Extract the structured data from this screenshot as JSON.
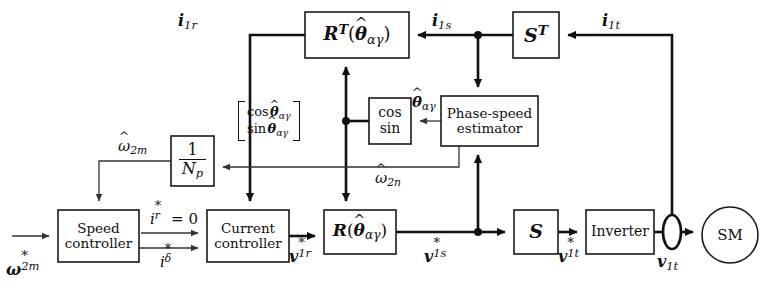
{
  "figure": {
    "type": "block-diagram",
    "background": "#ffffff",
    "line_color": "#111111",
    "width": 784,
    "height": 292
  },
  "blocks": [
    {
      "id": "rt",
      "name": "rotation-transform-inverse-block",
      "label": "R^T(θ̂_αγ)",
      "x": 305,
      "y": 12,
      "w": 104,
      "h": 46
    },
    {
      "id": "st",
      "name": "s-transform-transpose-block",
      "label": "S^T",
      "x": 513,
      "y": 12,
      "w": 46,
      "h": 46
    },
    {
      "id": "cossin",
      "name": "cos-sin-block",
      "label": "cos sin",
      "x": 369,
      "y": 98,
      "w": 42,
      "h": 46
    },
    {
      "id": "estimator",
      "name": "phase-speed-estimator-block",
      "label": "Phase-speed estimator",
      "x": 441,
      "y": 96,
      "w": 97,
      "h": 50
    },
    {
      "id": "invnp",
      "name": "inverse-pole-pairs-block",
      "label": "1 / N_p",
      "x": 171,
      "y": 136,
      "w": 43,
      "h": 50
    },
    {
      "id": "speed",
      "name": "speed-controller-block",
      "label": "Speed controller",
      "x": 58,
      "y": 210,
      "w": 81,
      "h": 52
    },
    {
      "id": "current",
      "name": "current-controller-block",
      "label": "Current controller",
      "x": 207,
      "y": 210,
      "w": 82,
      "h": 52
    },
    {
      "id": "r",
      "name": "rotation-transform-block",
      "label": "R(θ̂_αγ)",
      "x": 324,
      "y": 210,
      "w": 72,
      "h": 44
    },
    {
      "id": "s",
      "name": "s-transform-block",
      "label": "S",
      "x": 514,
      "y": 210,
      "w": 44,
      "h": 44
    },
    {
      "id": "inverter",
      "name": "inverter-block",
      "label": "Inverter",
      "x": 586,
      "y": 210,
      "w": 68,
      "h": 44
    },
    {
      "id": "sm",
      "name": "synchronous-machine-block",
      "label": "SM",
      "x": 702,
      "y": 207,
      "w": 56,
      "h": 56
    }
  ],
  "block_text": {
    "rt_base": "R",
    "rt_sup": "T",
    "rt_arg_open": "(",
    "rt_arg_theta": "θ",
    "rt_arg_sub": "αγ",
    "rt_arg_close": ")",
    "st_base": "S",
    "st_sup": "T",
    "cos": "cos",
    "sin": "sin",
    "estimator_line1": "Phase-speed",
    "estimator_line2": "estimator",
    "np_num": "1",
    "np_den_base": "N",
    "np_den_sub": "p",
    "speed_line1": "Speed",
    "speed_line2": "controller",
    "current_line1": "Current",
    "current_line2": "controller",
    "r_base": "R",
    "r_arg_open": "(",
    "r_arg_theta": "θ",
    "r_arg_sub": "αγ",
    "r_arg_close": ")",
    "s_base": "S",
    "inverter": "Inverter",
    "sm": "SM",
    "matrix_row1_fn": "cos",
    "matrix_row1_theta": "θ",
    "matrix_row1_sub": "αγ",
    "matrix_row2_fn": "sin",
    "matrix_row2_theta": "θ",
    "matrix_row2_sub": "αγ"
  },
  "signals": [
    {
      "id": "i1r",
      "name": "signal-label-i1r",
      "text": "i_1r",
      "x": 196,
      "y": 23,
      "style": "bold-italic-vector"
    },
    {
      "id": "i1s",
      "name": "signal-label-i1s",
      "text": "i_1s",
      "x": 449,
      "y": 23,
      "style": "bold-italic-vector"
    },
    {
      "id": "i1t",
      "name": "signal-label-i1t",
      "text": "i_1t",
      "x": 619,
      "y": 23,
      "style": "bold-italic-vector"
    },
    {
      "id": "thetahat",
      "name": "signal-label-theta-hat",
      "text": "θ̂_αγ",
      "x": 421,
      "y": 105,
      "style": "italic-hat"
    },
    {
      "id": "wm",
      "name": "signal-label-omega-2m-hat",
      "text": "ω̂_2m",
      "x": 135,
      "y": 148,
      "style": "italic-hat"
    },
    {
      "id": "wn",
      "name": "signal-label-omega-2n-hat",
      "text": "ω̂_2n",
      "x": 392,
      "y": 180,
      "style": "italic-hat"
    },
    {
      "id": "wref",
      "name": "signal-label-omega-2m-ref",
      "text": "ω*_2m",
      "x": 26,
      "y": 270,
      "style": "bold-italic-star"
    },
    {
      "id": "irref",
      "name": "signal-label-ir-ref-zero",
      "text": "i*_r = 0",
      "x": 175,
      "y": 219,
      "style": "italic-star-eq"
    },
    {
      "id": "idref",
      "name": "signal-label-i-delta-ref",
      "text": "i*_δ",
      "x": 167,
      "y": 262,
      "style": "italic-star"
    },
    {
      "id": "v1r",
      "name": "signal-label-v1r-ref",
      "text": "v*_1r",
      "x": 302,
      "y": 257,
      "style": "bold-italic-star"
    },
    {
      "id": "v1s",
      "name": "signal-label-v1s-ref",
      "text": "v*_1s",
      "x": 438,
      "y": 257,
      "style": "bold-italic-star"
    },
    {
      "id": "v1tref",
      "name": "signal-label-v1t-ref",
      "text": "v*_1t",
      "x": 571,
      "y": 257,
      "style": "bold-italic-star"
    },
    {
      "id": "v1t",
      "name": "signal-label-v1t",
      "text": "v_1t",
      "x": 672,
      "y": 262,
      "style": "bold-italic-vector"
    }
  ],
  "signal_text": {
    "i": "i",
    "v": "v",
    "omega": "ω",
    "theta": "θ",
    "hat": "^",
    "star": "*",
    "sub_1r": "1r",
    "sub_1s": "1s",
    "sub_1t": "1t",
    "sub_2m": "2m",
    "sub_2n": "2n",
    "sub_r": "r",
    "sub_delta": "δ",
    "sub_alpha_gamma": "αγ",
    "equals_zero": "= 0"
  },
  "nodes": [
    {
      "name": "junction-dot-i1s",
      "x": 478,
      "y": 35
    },
    {
      "name": "junction-dot-cossin-output",
      "x": 346,
      "y": 121
    },
    {
      "name": "junction-dot-v1s",
      "x": 478,
      "y": 232
    }
  ],
  "sensor": {
    "name": "current-sensor-ellipse",
    "x": 672,
    "y": 232,
    "rx": 9,
    "ry": 17
  }
}
